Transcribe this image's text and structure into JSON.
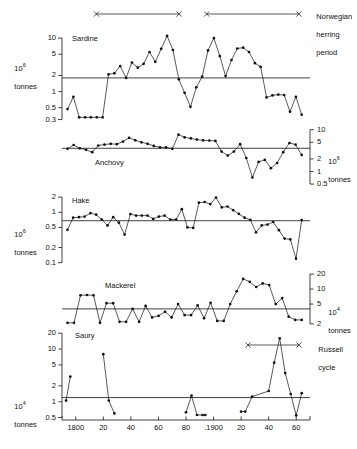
{
  "figure": {
    "annotations": [
      {
        "name": "norwegian-herring-period",
        "lines": [
          "Norwegian",
          "herring",
          "period"
        ]
      },
      {
        "name": "russell-cycle",
        "lines": [
          "Russell",
          "cycle"
        ]
      }
    ]
  },
  "chart_data": [
    {
      "type": "line",
      "title": "Sardine",
      "ylabel": "10⁶ tonnes",
      "unit_mantissa": "10",
      "unit_exponent": "6",
      "unit_word": "tonnes",
      "yaxis_side": "left",
      "yscale": "log",
      "yticks": [
        10,
        5,
        2,
        1,
        0.5,
        0.3
      ],
      "yticklabels": [
        "10",
        "5",
        "2",
        "1",
        "0.5",
        "0.3"
      ],
      "ylim": [
        0.27,
        13
      ],
      "mean_line": 1.8,
      "xlim": [
        1790,
        1970
      ],
      "x": [
        1792,
        1796,
        1800,
        1804,
        1808,
        1812,
        1816,
        1820,
        1824,
        1828,
        1832,
        1836,
        1840,
        1844,
        1848,
        1852,
        1856,
        1860,
        1864,
        1868,
        1872,
        1876,
        1880,
        1884,
        1888,
        1892,
        1896,
        1900,
        1904,
        1908,
        1912,
        1916,
        1920,
        1924,
        1928,
        1932,
        1936,
        1940,
        1944,
        1948,
        1952,
        1956,
        1960,
        1964,
        1968
      ],
      "values": [
        0.47,
        0.8,
        0.33,
        0.33,
        0.33,
        0.33,
        0.33,
        2.1,
        2.2,
        3.0,
        1.8,
        3.5,
        2.8,
        3.3,
        5.5,
        3.6,
        6.3,
        11.0,
        6.0,
        1.7,
        0.95,
        0.52,
        1.2,
        1.9,
        5.9,
        10.0,
        4.6,
        1.95,
        3.9,
        6.4,
        6.6,
        5.5,
        3.4,
        2.9,
        0.78,
        0.85,
        0.88,
        0.86,
        0.42,
        0.8,
        0.37
      ]
    },
    {
      "type": "line",
      "title": "Anchovy",
      "ylabel": "10⁶ tonnes",
      "unit_mantissa": "10",
      "unit_exponent": "6",
      "unit_word": "tonnes",
      "yaxis_side": "right",
      "yscale": "log",
      "yticks": [
        10,
        5,
        2,
        1,
        0.5
      ],
      "yticklabels": [
        "10",
        "5",
        "2",
        "1",
        "0.5"
      ],
      "ylim": [
        0.45,
        11
      ],
      "mean_line": 3.6,
      "xlim": [
        1790,
        1970
      ],
      "values": [
        3.5,
        4.3,
        3.6,
        3.3,
        2.9,
        4.2,
        4.4,
        4.6,
        4.5,
        5.2,
        6.4,
        5.6,
        5.0,
        4.6,
        4.1,
        3.8,
        3.8,
        3.5,
        7.6,
        6.6,
        6.2,
        5.8,
        5.6,
        5.5,
        5.4,
        3.0,
        2.4,
        3.0,
        4.5,
        2.1,
        0.72,
        1.7,
        1.9,
        1.2,
        1.6,
        2.9,
        4.8,
        4.4,
        2.5
      ]
    },
    {
      "type": "line",
      "title": "Hake",
      "ylabel": "10⁶ tonnes",
      "unit_mantissa": "10",
      "unit_exponent": "6",
      "unit_word": "tonnes",
      "yaxis_side": "left",
      "yscale": "log",
      "yticks": [
        2,
        1,
        0.5,
        0.2,
        0.1
      ],
      "yticklabels": [
        "2",
        "1",
        "0.5",
        "0.2",
        "0.1"
      ],
      "ylim": [
        0.09,
        2.2
      ],
      "mean_line": 0.68,
      "xlim": [
        1790,
        1970
      ],
      "values": [
        0.45,
        0.78,
        0.8,
        0.82,
        0.96,
        0.9,
        0.72,
        0.55,
        0.8,
        0.62,
        0.36,
        0.92,
        0.86,
        0.86,
        0.86,
        0.74,
        0.82,
        0.86,
        0.72,
        0.72,
        1.15,
        0.5,
        0.49,
        1.55,
        1.6,
        1.45,
        1.95,
        1.25,
        1.3,
        1.1,
        0.93,
        0.78,
        0.71,
        0.4,
        0.55,
        0.57,
        0.64,
        0.44,
        0.3,
        0.29,
        0.12,
        0.7
      ]
    },
    {
      "type": "line",
      "title": "Mackerel",
      "ylabel": "10⁴ tonnes",
      "unit_mantissa": "10",
      "unit_exponent": "4",
      "unit_word": "tonnes",
      "yaxis_side": "right",
      "yscale": "log",
      "yticks": [
        20,
        10,
        5,
        2
      ],
      "yticklabels": [
        "20",
        "10",
        "5",
        "2"
      ],
      "ylim": [
        1.9,
        22
      ],
      "mean_line": 4.0,
      "xlim": [
        1790,
        1970
      ],
      "values": [
        2.1,
        2.1,
        7.5,
        7.6,
        7.5,
        2.1,
        5.2,
        5.2,
        2.2,
        2.2,
        4.0,
        2.2,
        4.6,
        2.7,
        2.9,
        3.5,
        2.7,
        5.0,
        3.0,
        3.0,
        4.7,
        2.6,
        5.3,
        2.3,
        2.3,
        5.0,
        9.0,
        16.0,
        14.0,
        11.0,
        13.0,
        12.0,
        5.0,
        6.6,
        2.8,
        2.4,
        2.4
      ]
    },
    {
      "type": "line",
      "title": "Saury",
      "ylabel": "10⁴ tonnes",
      "unit_mantissa": "10",
      "unit_exponent": "4",
      "unit_word": "tonnes",
      "yaxis_side": "left",
      "yscale": "log",
      "yticks": [
        20,
        10,
        5,
        2,
        1,
        0.5
      ],
      "yticklabels": [
        "20",
        "10",
        "5",
        "2",
        "1",
        "0.5"
      ],
      "ylim": [
        0.45,
        23
      ],
      "mean_line": 1.2,
      "xlim": [
        1790,
        1970
      ],
      "segments": [
        {
          "x": [
            1793,
            1796
          ],
          "values": [
            1.05,
            3.0
          ]
        },
        {
          "x": [
            1820,
            1824,
            1828
          ],
          "values": [
            8.0,
            1.05,
            0.6
          ]
        },
        {
          "x": [
            1880,
            1884,
            1888,
            1892,
            1894
          ],
          "values": [
            0.63,
            1.3,
            0.56,
            0.56,
            0.56
          ]
        },
        {
          "x": [
            1920,
            1923,
            1928,
            1940,
            1944,
            1948,
            1952,
            1956,
            1960,
            1964,
            1968
          ],
          "values": [
            0.65,
            0.65,
            1.25,
            1.6,
            5.5,
            16.0,
            3.5,
            1.4,
            0.55,
            1.45
          ]
        }
      ]
    }
  ],
  "xaxis": {
    "ticks": [
      1800,
      1820,
      1840,
      1860,
      1880,
      1900,
      1920,
      1940,
      1960
    ],
    "ticklabels": [
      "1800",
      "20",
      "40",
      "60",
      "80",
      ".1900",
      "20",
      "40",
      "60"
    ]
  },
  "period_bars": [
    {
      "name": "herring-bar-1",
      "label": "",
      "x_start": 1815,
      "x_end": 1875
    },
    {
      "name": "herring-bar-2",
      "label": "",
      "x_start": 1895,
      "x_end": 1962
    },
    {
      "name": "russell-bar",
      "label": "",
      "x_start": 1925,
      "x_end": 1962
    }
  ]
}
